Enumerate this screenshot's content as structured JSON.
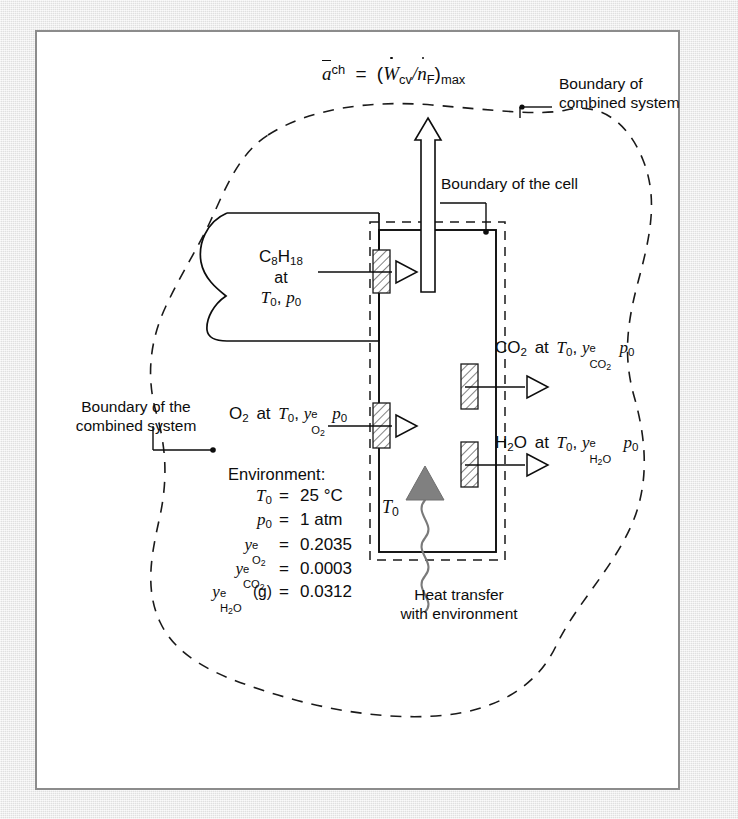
{
  "figure": {
    "title_equation": "a-bar^ch = (W-dot_cv / n-dot_F)_max",
    "kind": "fuel-cell-chemical-exergy-schematic"
  },
  "labels": {
    "work_output": {
      "a_symbol": "a",
      "a_sup": "ch",
      "equals": "=",
      "paren_open": "(",
      "w_symbol": "W",
      "w_sub": "cv",
      "slash": "/",
      "n_symbol": "n",
      "n_sub": "F",
      "paren_close": ")",
      "max_sub": "max"
    },
    "boundary_combined_top": "Boundary of\ncombined system",
    "boundary_combined_top_line1": "Boundary of",
    "boundary_combined_top_line2": "combined system",
    "boundary_cell": "Boundary of the cell",
    "boundary_combined_left_line1": "Boundary of the",
    "boundary_combined_left_line2": "combined system",
    "fuel_inlet": {
      "formula_c": "C",
      "formula_c_sub": "8",
      "formula_h": "H",
      "formula_h_sub": "18",
      "at": "at",
      "T": "T",
      "T_sub": "0",
      "comma": ",",
      "p": "p",
      "p_sub": "0"
    },
    "oxygen_inlet": {
      "species": "O",
      "species_sub": "2",
      "at": "at",
      "T": "T",
      "T_sub": "0",
      "comma": ",",
      "y": "y",
      "y_sup": "e",
      "y_sub": "O",
      "y_sub_num": "2",
      "p": "p",
      "p_sub": "0"
    },
    "co2_exit": {
      "species": "CO",
      "species_sub": "2",
      "at": "at",
      "T": "T",
      "T_sub": "0",
      "comma": ",",
      "y": "y",
      "y_sup": "e",
      "y_sub": "CO",
      "y_sub_num": "2",
      "p": "p",
      "p_sub": "0"
    },
    "h2o_exit": {
      "species_h": "H",
      "species_h_sub": "2",
      "species_o": "O",
      "at": "at",
      "T": "T",
      "T_sub": "0",
      "comma": ",",
      "y": "y",
      "y_sup": "e",
      "y_sub": "H",
      "y_sub_num": "2",
      "y_sub_o": "O",
      "p": "p",
      "p_sub": "0"
    },
    "heat_transfer_line1": "Heat transfer",
    "heat_transfer_line2": "with environment",
    "heat_arrow_temp": "T",
    "heat_arrow_temp_sub": "0"
  },
  "environment": {
    "heading": "Environment:",
    "rows": [
      {
        "sym": "T",
        "sym_sub": "0",
        "sym_sup": "",
        "sym_sub2": "",
        "eq": "=",
        "value": "25 °C"
      },
      {
        "sym": "p",
        "sym_sub": "0",
        "sym_sup": "",
        "sym_sub2": "",
        "eq": "=",
        "value": "1 atm"
      },
      {
        "sym": "y",
        "sym_sub": "O",
        "sym_sub2": "2",
        "sym_sup": "e",
        "eq": "=",
        "value": "0.2035"
      },
      {
        "sym": "y",
        "sym_sub": "CO",
        "sym_sub2": "2",
        "sym_sup": "e",
        "eq": "=",
        "value": "0.0003"
      },
      {
        "sym": "y",
        "sym_sub": "H",
        "sym_sub2": "2",
        "sym_sub3": "O",
        "sym_suffix": "(g)",
        "sym_sup": "e",
        "eq": "=",
        "value": "0.0312"
      }
    ],
    "T0_value": "25 °C",
    "p0_value": "1 atm",
    "yO2_value": "0.2035",
    "yCO2_value": "0.0003",
    "yH2O_value": "0.0312"
  },
  "colors": {
    "ink": "#0d0d0d",
    "page_bg": "#e9e9e9",
    "panel_bg": "#ffffff",
    "panel_border": "#8c8c8c",
    "heat_arrow_fill": "#808080",
    "hatch_stroke": "#1a1a1a"
  }
}
